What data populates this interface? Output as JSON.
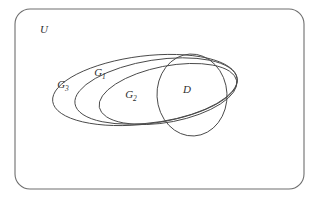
{
  "diagram": {
    "kind": "euler-venn-diagram",
    "title": "",
    "background_color": "#ffffff",
    "stroke_color": "#4a4a4a",
    "frame_stroke_color": "#6e6e6e",
    "label_color": "#2e2e2e",
    "universe": {
      "label": "U",
      "shape": "rounded-rectangle",
      "label_x": 44,
      "label_y": 30,
      "x": 15,
      "y": 9,
      "width": 289,
      "height": 180,
      "corner_radius": 15
    },
    "sets": [
      {
        "id": "g3",
        "label": "G",
        "subscript": "3",
        "shape": "ellipse",
        "label_x": 63,
        "label_y": 85,
        "cx": 145,
        "cy": 90,
        "rx": 93,
        "ry": 34,
        "rotation": -7
      },
      {
        "id": "g1",
        "label": "G",
        "subscript": "1",
        "shape": "ellipse",
        "label_x": 100,
        "label_y": 73,
        "cx": 156,
        "cy": 91,
        "rx": 82,
        "ry": 31,
        "rotation": -9
      },
      {
        "id": "g2",
        "label": "G",
        "subscript": "2",
        "shape": "ellipse",
        "label_x": 131,
        "label_y": 95,
        "cx": 168,
        "cy": 94,
        "rx": 70,
        "ry": 28,
        "rotation": -11
      },
      {
        "id": "d",
        "label": "D",
        "subscript": "",
        "shape": "ellipse",
        "label_x": 187,
        "label_y": 90,
        "cx": 192,
        "cy": 95,
        "rx": 35,
        "ry": 41,
        "rotation": -3
      }
    ]
  }
}
